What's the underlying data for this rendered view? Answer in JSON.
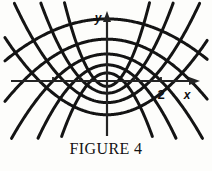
{
  "figure": {
    "caption": "FIGURE 4",
    "background_color": "#fdfdfb",
    "curve_color": "#141414",
    "axis_color": "#242424"
  },
  "axes": {
    "x_label": "x",
    "y_label": "y",
    "x_tick_labels": [
      "2"
    ],
    "origin_px": {
      "x": 107,
      "y": 81
    },
    "unit_px": 27,
    "x_ticks_units": [
      -2,
      -1,
      1,
      2
    ],
    "x_range_units": [
      -3.7,
      3.4
    ],
    "y_range_units": [
      -2.2,
      2.6
    ]
  },
  "chart_data": {
    "type": "line",
    "title": "FIGURE 4",
    "xlabel": "x",
    "ylabel": "y",
    "subtitle": "Orthogonal families of confocal parabolas",
    "grid": false,
    "legend": "none",
    "xlim": [
      -3.7,
      3.4
    ],
    "ylim": [
      -2.2,
      2.6
    ],
    "xticks": [
      2
    ],
    "xtick_labels": [
      "2"
    ],
    "series": [
      {
        "name": "parabola-up-1",
        "family": "upward",
        "equation": "y = x^2/(4a) - a, a = 0.20",
        "a": 0.2,
        "color": "#141414"
      },
      {
        "name": "parabola-up-2",
        "family": "upward",
        "equation": "y = x^2/(4a) - a, a = 0.45",
        "a": 0.45,
        "color": "#141414"
      },
      {
        "name": "parabola-up-3",
        "family": "upward",
        "equation": "y = x^2/(4a) - a, a = 0.80",
        "a": 0.8,
        "color": "#141414"
      },
      {
        "name": "parabola-up-4",
        "family": "upward",
        "equation": "y = x^2/(4a) - a, a = 1.25",
        "a": 1.25,
        "color": "#141414"
      },
      {
        "name": "parabola-down-1",
        "family": "downward",
        "equation": "y = b - x^2/(4b), b = 0.30",
        "b": 0.3,
        "color": "#141414"
      },
      {
        "name": "parabola-down-2",
        "family": "downward",
        "equation": "y = b - x^2/(4b), b = 0.60",
        "b": 0.6,
        "color": "#141414"
      },
      {
        "name": "parabola-down-3",
        "family": "downward",
        "equation": "y = b - x^2/(4b), b = 1.00",
        "b": 1.0,
        "color": "#141414"
      },
      {
        "name": "parabola-down-4",
        "family": "downward",
        "equation": "y = b - x^2/(4b), b = 1.55",
        "b": 1.55,
        "color": "#141414"
      },
      {
        "name": "parabola-down-5",
        "family": "downward",
        "equation": "y = b - x^2/(4b), b = 2.30",
        "b": 2.3,
        "color": "#141414"
      }
    ]
  }
}
